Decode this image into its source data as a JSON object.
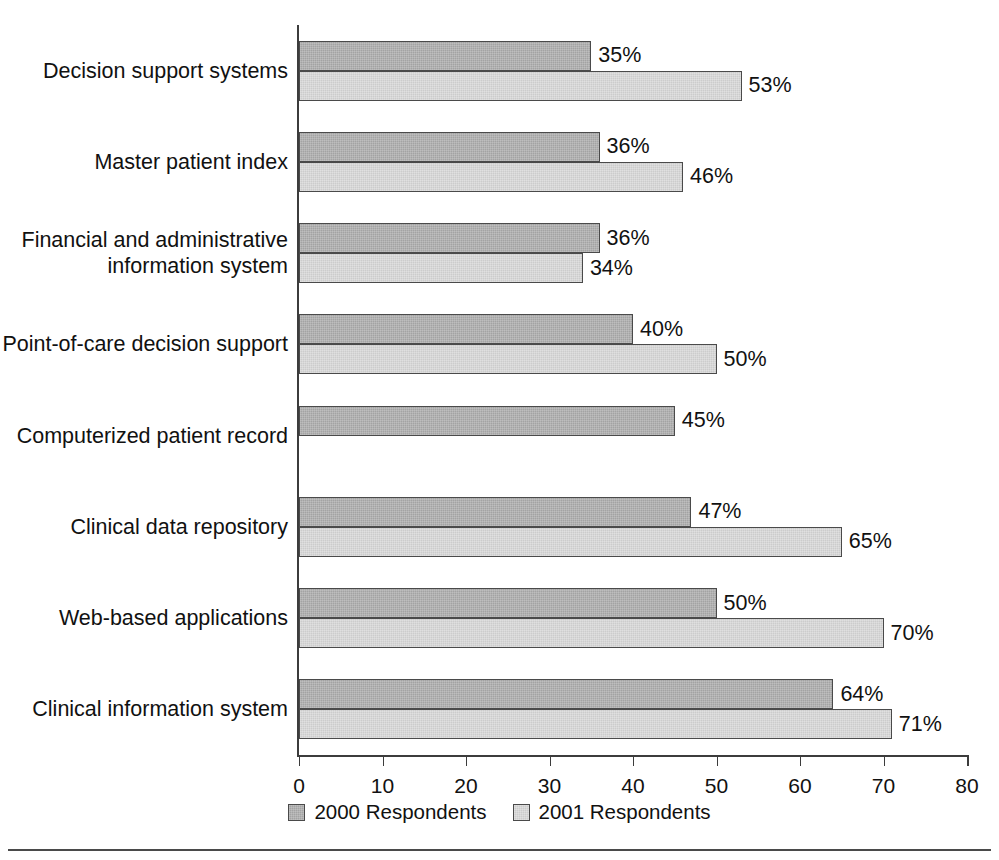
{
  "chart_data": {
    "type": "bar",
    "orientation": "horizontal",
    "title": "",
    "xlabel": "",
    "ylabel": "",
    "xlim": [
      0,
      80
    ],
    "xticks": [
      "0",
      "10",
      "20",
      "30",
      "40",
      "50",
      "60",
      "70",
      "80"
    ],
    "grid": false,
    "legend_position": "bottom-center",
    "value_suffix": "%",
    "categories": [
      "Decision support systems",
      "Master patient index",
      "Financial and administrative\ninformation system",
      "Point-of-care decision support",
      "Computerized patient record",
      "Clinical data repository",
      "Web-based applications",
      "Clinical information system"
    ],
    "series": [
      {
        "name": "2000 Respondents",
        "color": "#a3a3a3",
        "values": [
          35,
          36,
          36,
          40,
          45,
          47,
          50,
          64
        ],
        "labels": [
          "35%",
          "36%",
          "36%",
          "40%",
          "45%",
          "47%",
          "50%",
          "64%"
        ]
      },
      {
        "name": "2001 Respondents",
        "color": "#cccccc",
        "values": [
          53,
          46,
          34,
          50,
          null,
          65,
          70,
          71
        ],
        "labels": [
          "53%",
          "46%",
          "34%",
          "50%",
          "",
          "65%",
          "70%",
          "71%"
        ]
      }
    ]
  },
  "legend": {
    "items": [
      {
        "label": "2000 Respondents"
      },
      {
        "label": "2001 Respondents"
      }
    ]
  },
  "axis": {
    "line_color": "#3c3c3c"
  }
}
